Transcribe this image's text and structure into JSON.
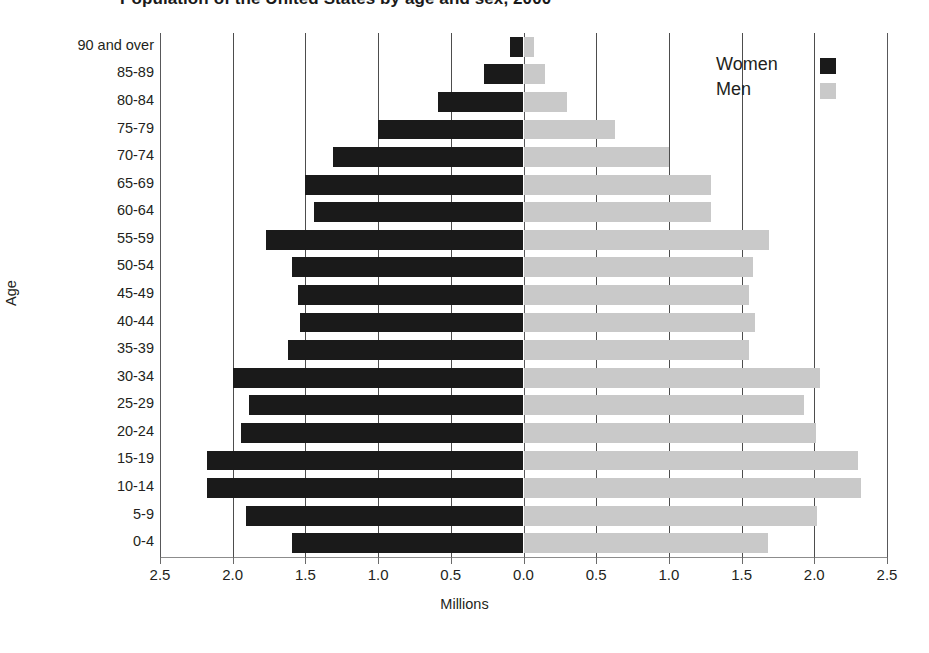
{
  "chart_data": {
    "type": "bar",
    "subtype": "population-pyramid",
    "title": "Population of the United States by age and sex, 2000",
    "xlabel": "Millions",
    "ylabel": "Age",
    "grid": true,
    "legend_position": "top-right",
    "axis_max_millions": 2.5,
    "x_tick_labels": [
      "2.5",
      "2.0",
      "1.5",
      "1.0",
      "0.5",
      "0.0",
      "0.5",
      "1.0",
      "1.5",
      "2.0",
      "2.5"
    ],
    "x_tick_values": [
      -2.5,
      -2.0,
      -1.5,
      -1.0,
      -0.5,
      0.0,
      0.5,
      1.0,
      1.5,
      2.0,
      2.5
    ],
    "categories": [
      "90 and over",
      "85-89",
      "80-84",
      "75-79",
      "70-74",
      "65-69",
      "60-64",
      "55-59",
      "50-54",
      "45-49",
      "40-44",
      "35-39",
      "30-34",
      "25-29",
      "20-24",
      "15-19",
      "10-14",
      "5-9",
      "0-4"
    ],
    "series": [
      {
        "name": "Women",
        "color": "#1a1a1a",
        "side": "left",
        "values": [
          0.09,
          0.27,
          0.59,
          1.0,
          1.31,
          1.5,
          1.44,
          1.77,
          1.59,
          1.55,
          1.54,
          1.62,
          2.0,
          1.89,
          1.94,
          2.18,
          2.18,
          1.91,
          1.59
        ]
      },
      {
        "name": "Men",
        "color": "#c9c9c9",
        "side": "right",
        "values": [
          0.07,
          0.15,
          0.3,
          0.63,
          1.0,
          1.29,
          1.29,
          1.69,
          1.58,
          1.55,
          1.59,
          1.55,
          2.04,
          1.93,
          2.01,
          2.3,
          2.32,
          2.02,
          1.68
        ]
      }
    ]
  },
  "legend": {
    "items": [
      {
        "label": "Women",
        "color": "#1a1a1a"
      },
      {
        "label": "Men",
        "color": "#c9c9c9"
      }
    ]
  }
}
